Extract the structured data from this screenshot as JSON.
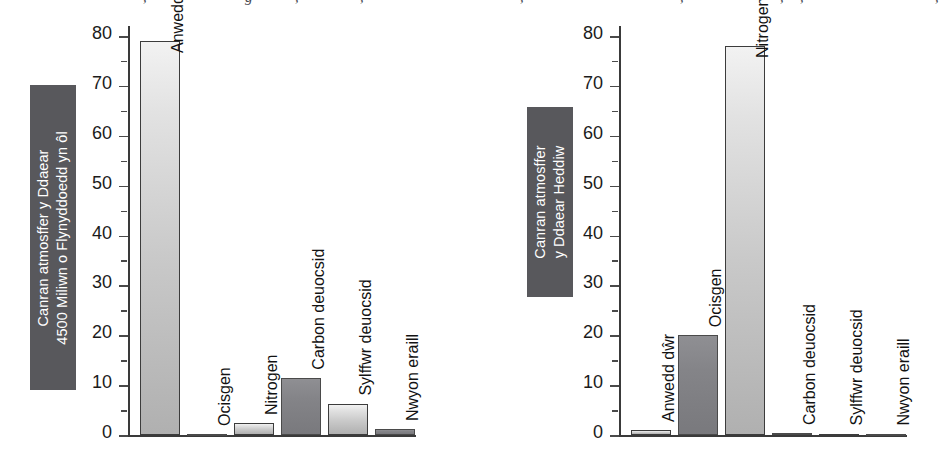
{
  "page": {
    "width": 948,
    "height": 469,
    "background": "#ffffff",
    "top_text_fragments": [
      ", ",
      "g",
      ", ",
      ", ",
      ", ",
      ", ",
      ", ",
      ", ",
      ", "
    ]
  },
  "style": {
    "axis_title_box_color": "#58585c",
    "axis_title_text_color": "#ffffff",
    "bar_light_top": "#f2f2f2",
    "bar_light_bottom": "#b0b0b0",
    "bar_dark": "#848488",
    "axis_color": "#3a3a3a",
    "tick_label_color": "#1b1b1b"
  },
  "chart_data": [
    {
      "id": "left",
      "type": "bar",
      "title": "",
      "ylabel": "Canran atmosffer y Ddaear 4500 Miliwn o Flynyddoedd yn ôl",
      "ylabel_lines": [
        "Canran atmosffer y Ddaear",
        "4500 Miliwn o Flynyddoedd yn ôl"
      ],
      "xlabel": "",
      "ylim": [
        0,
        80
      ],
      "yticks": [
        0,
        10,
        20,
        30,
        40,
        50,
        60,
        70,
        80
      ],
      "ytick_labels": [
        "0",
        "10",
        "20",
        "30",
        "40",
        "50",
        "60",
        "70",
        "80"
      ],
      "minor_tick_step": 5,
      "grid": false,
      "legend": "none",
      "categories": [
        "Anwedd dŵr",
        "Ocisgen",
        "Nitrogen",
        "Carbon deuocsid",
        "Sylffwr deuocsid",
        "Nwyon eraill"
      ],
      "values": [
        79,
        0,
        2.4,
        11.5,
        6.3,
        1.2
      ],
      "bar_shades": [
        "light",
        "dark",
        "light",
        "dark",
        "light",
        "dark"
      ]
    },
    {
      "id": "right",
      "type": "bar",
      "title": "",
      "ylabel": "Canran atmosffer y Ddaear Heddiw",
      "ylabel_lines": [
        "Canran atmosffer",
        "y Ddaear Heddiw"
      ],
      "xlabel": "",
      "ylim": [
        0,
        80
      ],
      "yticks": [
        0,
        10,
        20,
        30,
        40,
        50,
        60,
        70,
        80
      ],
      "ytick_labels": [
        "0",
        "10",
        "20",
        "30",
        "40",
        "50",
        "60",
        "70",
        "80"
      ],
      "minor_tick_step": 5,
      "grid": false,
      "legend": "none",
      "categories": [
        "Anwedd dŵr",
        "Ocisgen",
        "Nitrogen",
        "Carbon deuocsid",
        "Sylffwr deuocsid",
        "Nwyon eraill"
      ],
      "values": [
        1.0,
        20,
        78,
        0.4,
        0.3,
        0.3
      ],
      "bar_shades": [
        "light",
        "dark",
        "light",
        "dark",
        "light",
        "dark"
      ]
    }
  ]
}
